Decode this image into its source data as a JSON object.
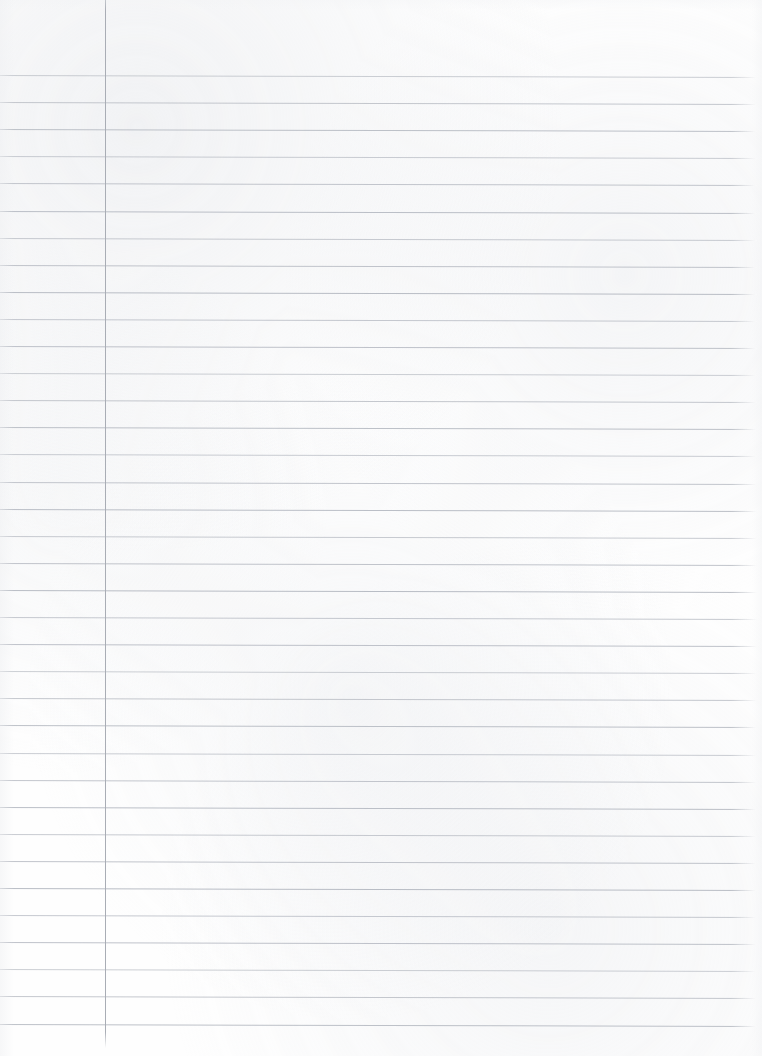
{
  "document": {
    "kind": "scanned-ruled-notebook-page",
    "page_width": 762,
    "page_height": 1056,
    "background_color": "#fefefe",
    "written_content": "",
    "text_blocks": []
  },
  "ruling": {
    "rule_color": "#b8bcc4",
    "rule_thickness": 1,
    "rule_spacing": 27.1,
    "first_rule_y": 75,
    "last_rule_y": 1025,
    "rule_count": 36,
    "rule_start_x": 0,
    "rule_end_x": 757,
    "skew_px": 2,
    "top_margin_blank": 75
  },
  "margin_rule": {
    "color": "#a9adb5",
    "thickness": 1,
    "x": 105,
    "top_y": 0,
    "bottom_y": 1048
  }
}
